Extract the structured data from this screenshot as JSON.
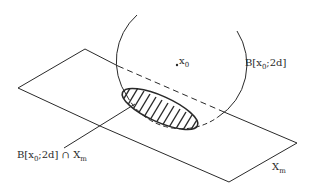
{
  "diagram": {
    "labels": {
      "center_point": {
        "name": "x",
        "sub": "0"
      },
      "ball": {
        "prefix": "B[x",
        "sub": "0",
        "suffix": ";2d]"
      },
      "intersection": {
        "prefix": "B[x",
        "sub": "0",
        "mid": ";2d] ∩ X",
        "sub2": "m"
      },
      "plane": {
        "name": "X",
        "sub": "m"
      }
    },
    "colors": {
      "stroke": "#2a2a2a",
      "background": "#ffffff"
    }
  }
}
